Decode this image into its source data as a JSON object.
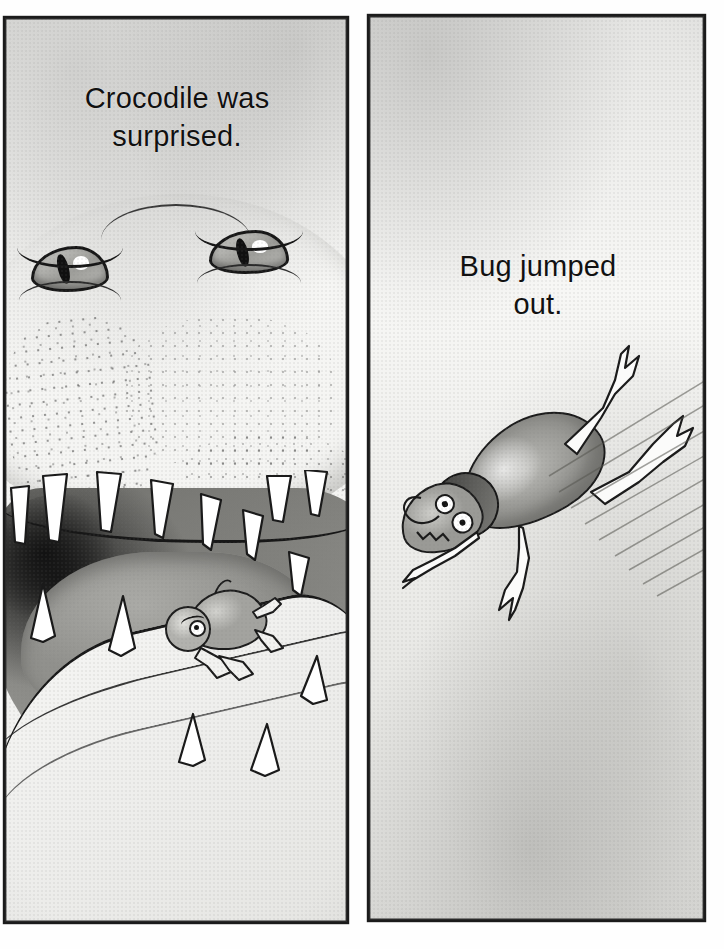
{
  "page": {
    "width": 724,
    "height": 949,
    "background_color": "#ffffff",
    "ink_color": "#1b1b1b",
    "paper_color": "#f3f3f1",
    "style": "hand-drawn pen-and-ink with grey watercolor wash",
    "panel_count": 2
  },
  "panels": [
    {
      "id": "panel-left",
      "name": "crocodile-panel",
      "position": {
        "x": 5,
        "y": 18,
        "width": 342,
        "height": 904
      },
      "caption": {
        "lines": [
          "Crocodile was",
          "surprised."
        ],
        "full_text": "Crocodile was surprised.",
        "align": "center",
        "font_size_px": 29,
        "color": "#111111"
      },
      "scene": {
        "subject": "crocodile head with open mouth",
        "description": "Close-up of a crocodile's head seen from the front, eyes wide with surprise, jaws open showing rows of white triangular teeth, a small bug sitting inside the mouth.",
        "elements": [
          "crocodile-eye-left",
          "crocodile-eye-right",
          "snout-ridge",
          "scale-texture",
          "upper-jaw",
          "open-mouth-cavity",
          "tongue",
          "lower-jaw",
          "teeth-row",
          "bug-inside-mouth"
        ],
        "tooth_count_upper": 9,
        "tooth_count_lower": 5,
        "bug_expression": "annoyed / frowning"
      }
    },
    {
      "id": "panel-right",
      "name": "bug-panel",
      "position": {
        "x": 369,
        "y": 16,
        "width": 335,
        "height": 904
      },
      "caption": {
        "lines": [
          "Bug jumped",
          "out."
        ],
        "full_text": "Bug jumped out.",
        "align": "center",
        "font_size_px": 29,
        "color": "#111111"
      },
      "scene": {
        "subject": "bug leaping through the air",
        "description": "The bug flies diagonally down-left through empty grey space, legs trailing behind, with motion speed-lines streaking up to the right.",
        "elements": [
          "bug-abdomen",
          "bug-thorax",
          "bug-head",
          "bug-eyes",
          "bug-legs",
          "motion-speed-lines"
        ],
        "motion_direction": "down-left",
        "speed_line_count": 9,
        "bug_leg_count": 6
      }
    }
  ],
  "palette": {
    "ink": "#1b1b1b",
    "paper_light": "#f6f6f4",
    "wash_mid": "#b9b9b5",
    "wash_dark": "#6f6f6b",
    "tooth_white": "#ffffff",
    "mouth_shadow": "#121212"
  }
}
